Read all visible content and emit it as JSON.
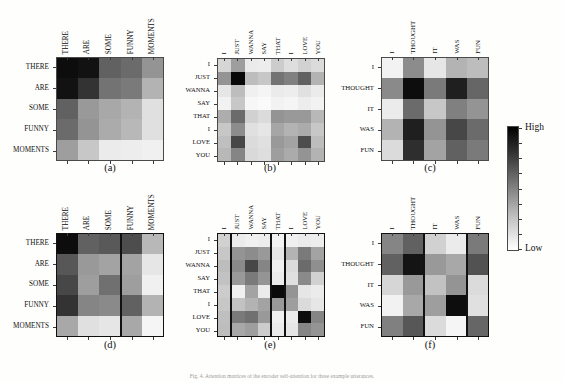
{
  "figure": {
    "footnote": "Fig. 4. Attention matrices of the encoder self-attention for three example utterances.",
    "panel_caption_a": "(a)",
    "panel_caption_b": "(b)",
    "panel_caption_c": "(c)",
    "panel_caption_d": "(d)",
    "panel_caption_e": "(e)",
    "panel_caption_f": "(f)"
  },
  "colorbar": {
    "name": "intensity-colorbar",
    "high_label": "High",
    "low_label": "Low",
    "high_color": "#000000",
    "low_color": "#ffffff",
    "orientation": "vertical",
    "tick_count": 9
  },
  "chart_data": [
    {
      "id": "a",
      "type": "heatmap",
      "title": "(a)",
      "xlabel": "",
      "ylabel": "",
      "colormap": "gray_reversed",
      "zlim": [
        0,
        1
      ],
      "segment_boundaries": [],
      "categories": [
        "THERE",
        "ARE",
        "SOME",
        "FUNNY",
        "MOMENTS"
      ],
      "rows": [
        "THERE",
        "ARE",
        "SOME",
        "FUNNY",
        "MOMENTS"
      ],
      "columns": [
        "THERE",
        "ARE",
        "SOME",
        "FUNNY",
        "MOMENTS"
      ],
      "values": [
        [
          0.95,
          0.93,
          0.62,
          0.58,
          0.42
        ],
        [
          0.93,
          0.8,
          0.55,
          0.52,
          0.3
        ],
        [
          0.62,
          0.4,
          0.34,
          0.3,
          0.12
        ],
        [
          0.58,
          0.42,
          0.33,
          0.28,
          0.12
        ],
        [
          0.38,
          0.22,
          0.08,
          0.07,
          0.06
        ]
      ]
    },
    {
      "id": "b",
      "type": "heatmap",
      "title": "(b)",
      "xlabel": "",
      "ylabel": "",
      "colormap": "gray_reversed",
      "zlim": [
        0,
        1
      ],
      "segment_boundaries": [],
      "categories": [
        "I",
        "JUST",
        "WANNA",
        "SAY",
        "THAT",
        "I",
        "LOVE",
        "YOU"
      ],
      "rows": [
        "I",
        "JUST",
        "WANNA",
        "SAY",
        "THAT",
        "I",
        "LOVE",
        "YOU"
      ],
      "columns": [
        "I",
        "JUST",
        "WANNA",
        "SAY",
        "THAT",
        "I",
        "LOVE",
        "YOU"
      ],
      "values": [
        [
          0.16,
          0.38,
          0.08,
          0.07,
          0.2,
          0.13,
          0.18,
          0.14
        ],
        [
          0.42,
          0.97,
          0.26,
          0.22,
          0.55,
          0.5,
          0.62,
          0.3
        ],
        [
          0.1,
          0.26,
          0.06,
          0.04,
          0.08,
          0.07,
          0.12,
          0.08
        ],
        [
          0.05,
          0.22,
          0.03,
          0.02,
          0.05,
          0.04,
          0.07,
          0.05
        ],
        [
          0.32,
          0.58,
          0.18,
          0.14,
          0.42,
          0.4,
          0.4,
          0.28
        ],
        [
          0.22,
          0.45,
          0.12,
          0.1,
          0.35,
          0.3,
          0.33,
          0.22
        ],
        [
          0.25,
          0.72,
          0.14,
          0.12,
          0.4,
          0.36,
          0.7,
          0.26
        ],
        [
          0.28,
          0.48,
          0.15,
          0.13,
          0.38,
          0.33,
          0.42,
          0.3
        ]
      ]
    },
    {
      "id": "c",
      "type": "heatmap",
      "title": "(c)",
      "xlabel": "",
      "ylabel": "",
      "colormap": "gray_reversed",
      "zlim": [
        0,
        1
      ],
      "segment_boundaries": [],
      "categories": [
        "I",
        "THOUGHT",
        "IT",
        "WAS",
        "FUN"
      ],
      "rows": [
        "I",
        "THOUGHT",
        "IT",
        "WAS",
        "FUN"
      ],
      "columns": [
        "I",
        "THOUGHT",
        "IT",
        "WAS",
        "FUN"
      ],
      "values": [
        [
          0.05,
          0.45,
          0.1,
          0.3,
          0.26
        ],
        [
          0.46,
          0.95,
          0.52,
          0.88,
          0.6
        ],
        [
          0.08,
          0.58,
          0.22,
          0.5,
          0.42
        ],
        [
          0.3,
          0.88,
          0.42,
          0.72,
          0.58
        ],
        [
          0.14,
          0.82,
          0.36,
          0.62,
          0.52
        ]
      ]
    },
    {
      "id": "d",
      "type": "heatmap",
      "title": "(d)",
      "xlabel": "",
      "ylabel": "",
      "colormap": "gray_reversed",
      "zlim": [
        0,
        1
      ],
      "segment_boundaries": [
        3
      ],
      "categories": [
        "THERE",
        "ARE",
        "SOME",
        "FUNNY",
        "MOMENTS"
      ],
      "rows": [
        "THERE",
        "ARE",
        "SOME",
        "FUNNY",
        "MOMENTS"
      ],
      "columns": [
        "THERE",
        "ARE",
        "SOME",
        "FUNNY",
        "MOMENTS"
      ],
      "values": [
        [
          0.95,
          0.62,
          0.65,
          0.7,
          0.28
        ],
        [
          0.66,
          0.4,
          0.36,
          0.36,
          0.1
        ],
        [
          0.72,
          0.38,
          0.56,
          0.38,
          0.06
        ],
        [
          0.8,
          0.48,
          0.46,
          0.62,
          0.3
        ],
        [
          0.34,
          0.12,
          0.1,
          0.34,
          0.04
        ]
      ]
    },
    {
      "id": "e",
      "type": "heatmap",
      "title": "(e)",
      "xlabel": "",
      "ylabel": "",
      "colormap": "gray_reversed",
      "zlim": [
        0,
        1
      ],
      "segment_boundaries": [
        1,
        4,
        5
      ],
      "categories": [
        "I",
        "JUST",
        "WANNA",
        "SAY",
        "THAT",
        "I",
        "LOVE",
        "YOU"
      ],
      "rows": [
        "I",
        "JUST",
        "WANNA",
        "SAY",
        "THAT",
        "I",
        "LOVE",
        "YOU"
      ],
      "columns": [
        "I",
        "JUST",
        "WANNA",
        "SAY",
        "THAT",
        "I",
        "LOVE",
        "YOU"
      ],
      "values": [
        [
          0.18,
          0.08,
          0.06,
          0.07,
          0.05,
          0.06,
          0.08,
          0.07
        ],
        [
          0.22,
          0.42,
          0.45,
          0.4,
          0.1,
          0.3,
          0.52,
          0.36
        ],
        [
          0.26,
          0.46,
          0.72,
          0.48,
          0.06,
          0.14,
          0.58,
          0.44
        ],
        [
          0.24,
          0.4,
          0.52,
          0.42,
          0.08,
          0.12,
          0.46,
          0.18
        ],
        [
          0.2,
          0.06,
          0.36,
          0.08,
          0.96,
          0.42,
          0.1,
          0.08
        ],
        [
          0.22,
          0.24,
          0.3,
          0.36,
          0.4,
          0.38,
          0.14,
          0.1
        ],
        [
          0.25,
          0.52,
          0.56,
          0.4,
          0.06,
          0.08,
          0.95,
          0.48
        ],
        [
          0.26,
          0.34,
          0.38,
          0.2,
          0.08,
          0.1,
          0.48,
          0.42
        ]
      ]
    },
    {
      "id": "f",
      "type": "heatmap",
      "title": "(f)",
      "xlabel": "",
      "ylabel": "",
      "colormap": "gray_reversed",
      "zlim": [
        0,
        1
      ],
      "segment_boundaries": [
        2,
        4
      ],
      "categories": [
        "I",
        "THOUGHT",
        "IT",
        "WAS",
        "FUN"
      ],
      "rows": [
        "I",
        "THOUGHT",
        "IT",
        "WAS",
        "FUN"
      ],
      "columns": [
        "I",
        "THOUGHT",
        "IT",
        "WAS",
        "FUN"
      ],
      "values": [
        [
          0.48,
          0.62,
          0.18,
          0.08,
          0.52
        ],
        [
          0.62,
          0.92,
          0.4,
          0.34,
          0.68
        ],
        [
          0.16,
          0.4,
          0.24,
          0.42,
          0.14
        ],
        [
          0.05,
          0.34,
          0.38,
          0.95,
          0.12
        ],
        [
          0.5,
          0.66,
          0.14,
          0.04,
          0.6
        ]
      ]
    }
  ]
}
